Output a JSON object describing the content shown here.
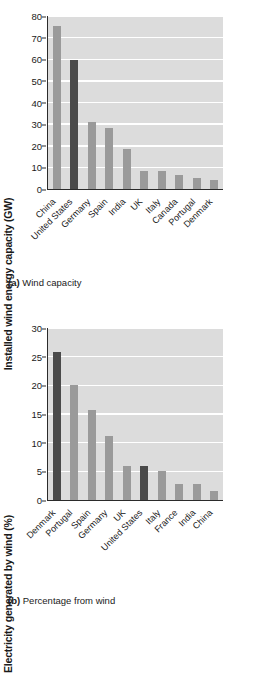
{
  "chart_data": [
    {
      "id": "a",
      "type": "bar",
      "title": "",
      "xlabel": "",
      "ylabel": "Installed wind energy capacity (GW)",
      "ylim": [
        0,
        80
      ],
      "yticks": [
        0,
        10,
        20,
        30,
        40,
        50,
        60,
        70,
        80
      ],
      "grid": true,
      "legend": "none",
      "categories": [
        "China",
        "United States",
        "Germany",
        "Spain",
        "India",
        "UK",
        "Italy",
        "Canada",
        "Portugal",
        "Denmark"
      ],
      "values": [
        75.5,
        59.5,
        31.0,
        28.2,
        18.3,
        8.2,
        8.2,
        6.6,
        5.3,
        4.0
      ],
      "highlighted": [
        "United States"
      ],
      "caption_tag": "(a)",
      "caption_text": "Wind capacity",
      "colors": {
        "bar": "#9a9a9a",
        "bar_highlight": "#4a4a4a",
        "plot_background": "#dcdcdc",
        "gridline": "#ffffff",
        "axis": "#2b2b2b"
      }
    },
    {
      "id": "b",
      "type": "bar",
      "title": "",
      "xlabel": "",
      "ylabel": "Electricity generated by wind (%)",
      "ylim": [
        0,
        30
      ],
      "yticks": [
        0,
        5,
        10,
        15,
        20,
        25,
        30
      ],
      "grid": true,
      "legend": "none",
      "categories": [
        "Denmark",
        "Portugal",
        "Spain",
        "Germany",
        "UK",
        "United States",
        "Italy",
        "France",
        "India",
        "China"
      ],
      "values": [
        25.8,
        20.0,
        15.7,
        11.2,
        5.9,
        5.9,
        5.1,
        2.8,
        2.8,
        1.5
      ],
      "highlighted": [
        "Denmark",
        "United States"
      ],
      "caption_tag": "(b)",
      "caption_text": "Percentage from wind",
      "colors": {
        "bar": "#9a9a9a",
        "bar_highlight": "#4a4a4a",
        "plot_background": "#dcdcdc",
        "gridline": "#ffffff",
        "axis": "#2b2b2b"
      }
    }
  ]
}
